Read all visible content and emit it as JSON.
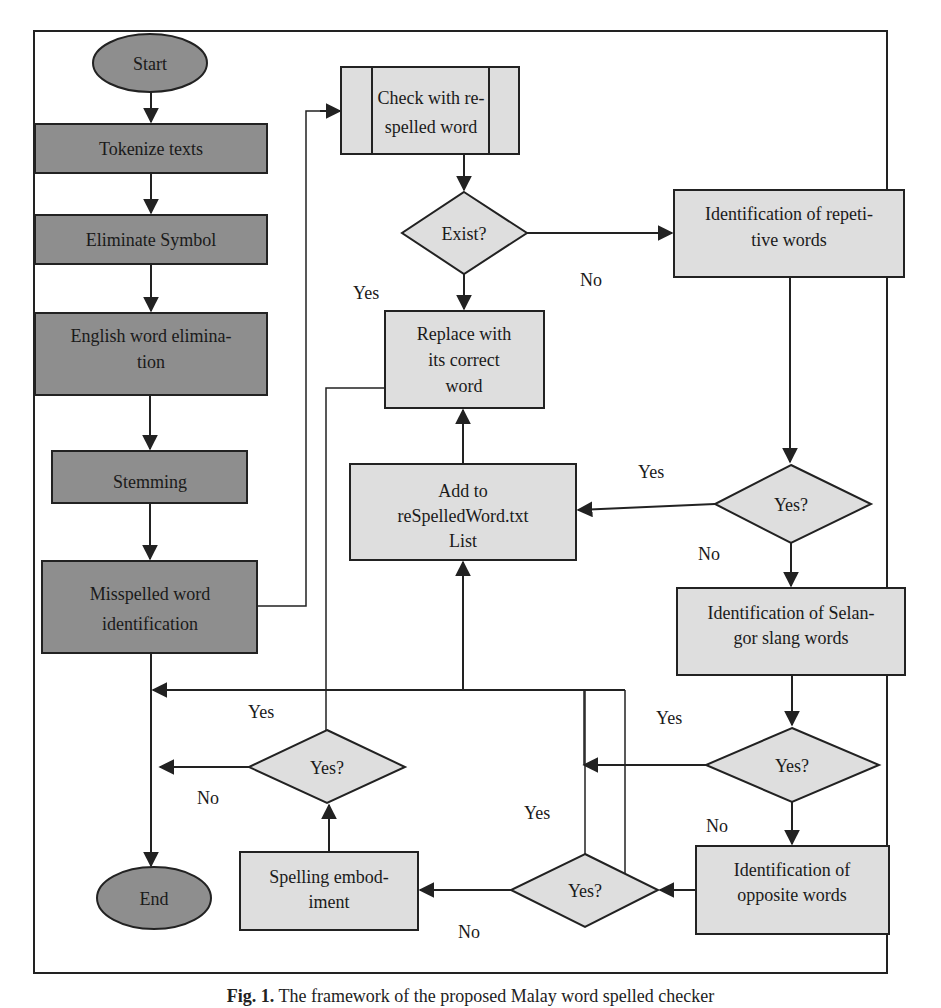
{
  "figure": {
    "caption_prefix": "Fig. 1.",
    "caption_text": "The framework of the proposed Malay word spelled checker",
    "colors": {
      "dark_node_fill": "#8e8e8e",
      "light_node_fill": "#dedede",
      "stroke": "#222222",
      "background": "#ffffff"
    }
  },
  "nodes": {
    "start": {
      "label": "Start",
      "shape": "ellipse"
    },
    "tokenize": {
      "label": "Tokenize texts",
      "shape": "rect"
    },
    "eliminate_symbol": {
      "label": "Eliminate Symbol",
      "shape": "rect"
    },
    "english_elim": {
      "line1": "English word elimina-",
      "line2": "tion",
      "shape": "rect"
    },
    "stemming": {
      "label": "Stemming",
      "shape": "rect"
    },
    "misspelled": {
      "line1": "Misspelled word",
      "line2": "identification",
      "shape": "rect"
    },
    "end": {
      "label": "End",
      "shape": "ellipse"
    },
    "check_respelled": {
      "line1": "Check with re-",
      "line2": "spelled word",
      "shape": "predefined-process"
    },
    "exist": {
      "label": "Exist?",
      "shape": "diamond"
    },
    "replace": {
      "line1": "Replace with",
      "line2": "its correct",
      "line3": "word",
      "shape": "rect"
    },
    "add_list": {
      "line1": "Add to",
      "line2": "reSpelledWord.txt",
      "line3": "List",
      "shape": "rect"
    },
    "repetitive": {
      "line1": "Identification of repeti-",
      "line2": "tive words",
      "shape": "rect"
    },
    "yes_decision_1": {
      "label": "Yes?",
      "shape": "diamond"
    },
    "selangor": {
      "line1": "Identification of Selan-",
      "line2": "gor slang words",
      "shape": "rect"
    },
    "yes_decision_2": {
      "label": "Yes?",
      "shape": "diamond"
    },
    "opposite": {
      "line1": "Identification of",
      "line2": "opposite words",
      "shape": "rect"
    },
    "yes_decision_3": {
      "label": "Yes?",
      "shape": "diamond"
    },
    "spelling_embodiment": {
      "line1": "Spelling embod-",
      "line2": "iment",
      "shape": "rect"
    },
    "yes_decision_4": {
      "label": "Yes?",
      "shape": "diamond"
    }
  },
  "edge_labels": {
    "exist_yes": "Yes",
    "exist_no": "No",
    "d1_yes": "Yes",
    "d1_no": "No",
    "d2_yes": "Yes",
    "d2_no": "No",
    "d3_yes": "Yes",
    "d3_no": "No",
    "d4_yes": "Yes",
    "d4_no": "No"
  }
}
